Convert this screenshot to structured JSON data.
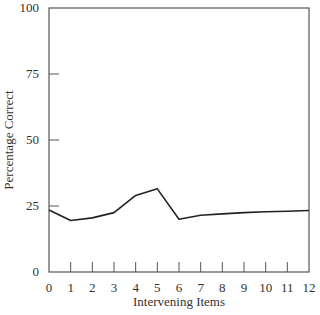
{
  "chart_data": {
    "type": "line",
    "title": "",
    "xlabel": "Intervening Items",
    "ylabel": "Percentage Correct",
    "x": [
      0,
      1,
      2,
      3,
      4,
      5,
      6,
      7,
      8,
      9,
      10,
      11,
      12
    ],
    "series": [
      {
        "name": "Percentage Correct",
        "values": [
          23.5,
          19.5,
          20.5,
          22.5,
          29,
          31.5,
          20,
          21.5,
          22,
          22.5,
          22.8,
          23,
          23.3
        ]
      }
    ],
    "xticks": [
      "0",
      "1",
      "2",
      "3",
      "4",
      "5",
      "6",
      "7",
      "8",
      "9",
      "10",
      "11",
      "12"
    ],
    "yticks": [
      "0",
      "25",
      "50",
      "75",
      "100"
    ],
    "xlim": [
      0,
      12
    ],
    "ylim": [
      0,
      100
    ],
    "grid": false,
    "legend": null
  }
}
